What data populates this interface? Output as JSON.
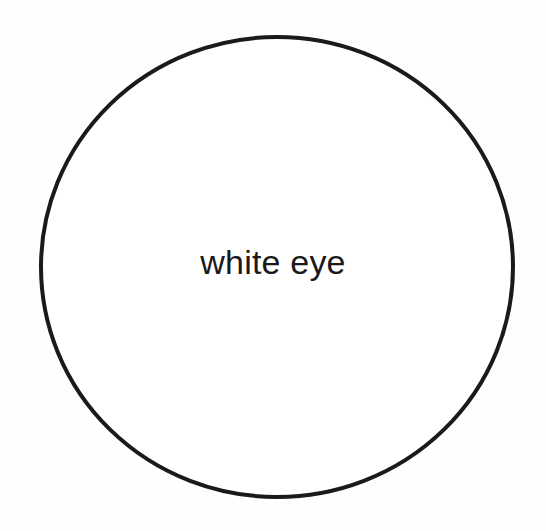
{
  "diagram": {
    "shape": "circle",
    "label": "white eye",
    "colors": {
      "stroke": "#1a1a1a",
      "fill": "#ffffff",
      "text": "#1a1a1a",
      "background": "#fefefe"
    }
  }
}
